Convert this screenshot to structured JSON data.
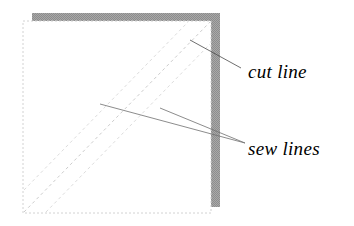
{
  "figure": {
    "background_color": "#ffffff"
  },
  "shapes": {
    "shadow_band": {
      "name": "gray-shadow-band",
      "color": "#9b9b9b",
      "x": 32,
      "y": 13,
      "width": 188,
      "height": 194
    },
    "fabric_square": {
      "name": "white-fabric-square",
      "fill": "#ffffff",
      "border_color": "#d0d0d0",
      "x": 23,
      "y": 21,
      "width": 188,
      "height": 192
    }
  },
  "lines": {
    "cut_line": {
      "name": "cut-diagonal",
      "color": "#c8c8c8",
      "x1": 24,
      "y1": 212,
      "x2": 210,
      "y2": 22
    },
    "sew_line_upper": {
      "name": "sew-diagonal-upper",
      "color": "#d5d5d5",
      "x1": 24,
      "y1": 190,
      "x2": 188,
      "y2": 22
    },
    "sew_line_lower": {
      "name": "sew-diagonal-lower",
      "color": "#d5d5d5",
      "x1": 46,
      "y1": 212,
      "x2": 210,
      "y2": 44
    }
  },
  "leaders": {
    "cut_leader": {
      "name": "cut-line-leader",
      "color": "#4a4a4a",
      "x1": 190,
      "y1": 40,
      "x2": 241,
      "y2": 68
    },
    "sew_leader_a": {
      "name": "sew-line-leader-a",
      "color": "#6a6a6a",
      "x1": 100,
      "y1": 104,
      "x2": 245,
      "y2": 143
    },
    "sew_leader_b": {
      "name": "sew-line-leader-b",
      "color": "#6a6a6a",
      "x1": 160,
      "y1": 108,
      "x2": 245,
      "y2": 143
    }
  },
  "labels": {
    "cut_line": {
      "text": "cut line",
      "x": 248,
      "y": 78
    },
    "sew_lines": {
      "text": "sew lines",
      "x": 248,
      "y": 155
    }
  }
}
